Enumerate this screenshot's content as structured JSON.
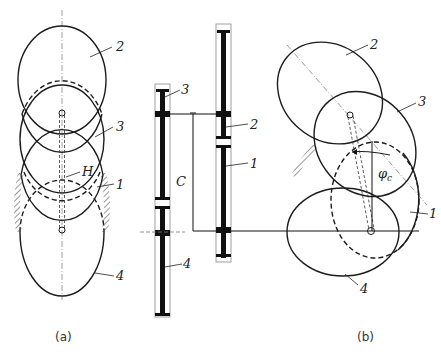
{
  "figure": {
    "subfigures": [
      {
        "id": "a",
        "caption": "(a)"
      },
      {
        "id": "b",
        "caption": "(b)"
      }
    ],
    "labels": {
      "a": {
        "gear2": "2",
        "gear3": "3",
        "carrier": "H",
        "gear1": "1",
        "gear4": "4"
      },
      "side": {
        "gear3": "3",
        "gear2": "2",
        "gear1": "1",
        "gear4": "4",
        "center_distance": "C"
      },
      "b": {
        "gear2": "2",
        "gear3": "3",
        "angle": "φ",
        "angle_sub": "c",
        "gear1": "1",
        "gear4": "4"
      }
    },
    "colors": {
      "line": "#1c1c1c",
      "background": "#ffffff",
      "gear_fill": "#111111"
    }
  }
}
